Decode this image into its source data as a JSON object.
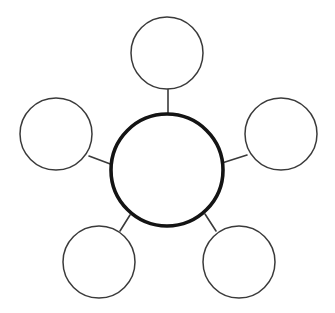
{
  "diagram": {
    "kind": "bubble-map",
    "title": "",
    "canvas": {
      "width": 335,
      "height": 313,
      "background": "#ffffff"
    },
    "style": {
      "center_stroke_color": "#141414",
      "center_stroke_width": 3.6,
      "satellite_stroke_color": "#3a3a3a",
      "satellite_stroke_width": 1.5,
      "connector_stroke_color": "#3a3a3a",
      "connector_stroke_width": 1.6,
      "fill_color": "#ffffff"
    },
    "center_node": {
      "id": "center",
      "label": "",
      "cx": 167,
      "cy": 170,
      "r": 56
    },
    "satellite_nodes": [
      {
        "id": "top",
        "label": "",
        "cx": 167,
        "cy": 53,
        "r": 36
      },
      {
        "id": "left",
        "label": "",
        "cx": 56,
        "cy": 134,
        "r": 36
      },
      {
        "id": "right",
        "label": "",
        "cx": 281,
        "cy": 134,
        "r": 36
      },
      {
        "id": "bottom-left",
        "label": "",
        "cx": 99,
        "cy": 262,
        "r": 36
      },
      {
        "id": "bottom-right",
        "label": "",
        "cx": 239,
        "cy": 262,
        "r": 36
      }
    ],
    "connectors": [
      {
        "id": "center-to-top",
        "x1": 168,
        "y1": 89,
        "x2": 168,
        "y2": 114
      },
      {
        "id": "center-to-left",
        "x1": 89,
        "y1": 156,
        "x2": 113,
        "y2": 165
      },
      {
        "id": "center-to-right",
        "x1": 222,
        "y1": 163,
        "x2": 247,
        "y2": 155
      },
      {
        "id": "center-to-bottom-left",
        "x1": 130,
        "y1": 215,
        "x2": 120,
        "y2": 231
      },
      {
        "id": "center-to-bottom-right",
        "x1": 205,
        "y1": 214,
        "x2": 216,
        "y2": 231
      }
    ]
  }
}
